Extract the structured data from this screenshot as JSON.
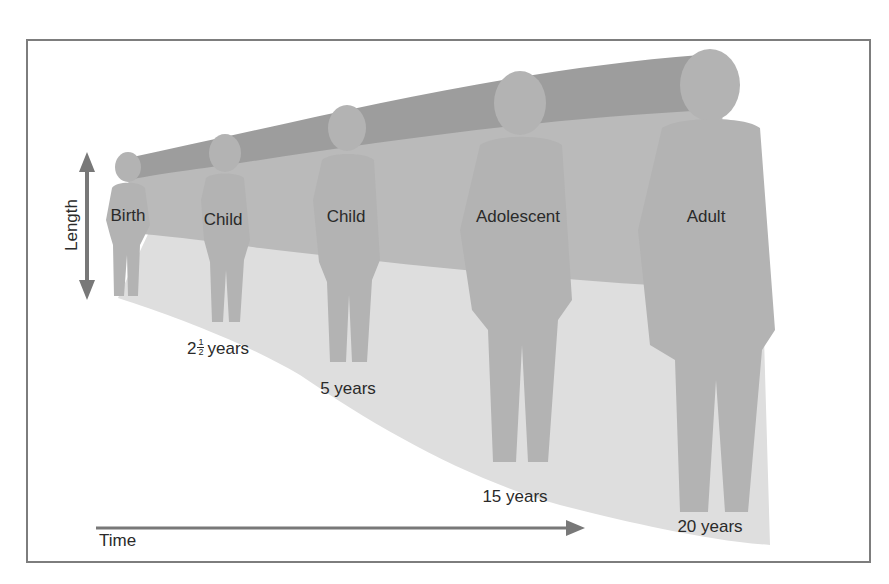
{
  "diagram": {
    "title": "",
    "axes": {
      "vertical_label": "Length",
      "horizontal_label": "Time"
    },
    "stages": [
      {
        "label": "Birth",
        "age_label": ""
      },
      {
        "label": "Child",
        "age_whole": "2",
        "age_frac_num": "1",
        "age_frac_den": "2",
        "age_unit": "years"
      },
      {
        "label": "Child",
        "age_label": "5 years"
      },
      {
        "label": "Adolescent",
        "age_label": "15 years"
      },
      {
        "label": "Adult",
        "age_label": "20 years"
      }
    ],
    "colors": {
      "frame": "#7d7d7d",
      "arrow": "#787878",
      "upper_band": "#9d9d9d",
      "middle_band": "#bababa",
      "floor": "#dedede",
      "figure": "#b3b3b3",
      "figure_leg": "#a6a6a6",
      "text": "#2a2a2a"
    }
  }
}
